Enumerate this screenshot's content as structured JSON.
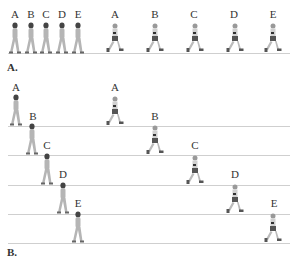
{
  "panels": [
    {
      "label": "A.",
      "description": "Walkers and runners in a single row",
      "walkers": [
        "A",
        "B",
        "C",
        "D",
        "E"
      ],
      "runners": [
        "A",
        "B",
        "C",
        "D",
        "E"
      ]
    },
    {
      "label": "B.",
      "description": "Walkers and runners staggered across rows",
      "walkers": [
        "A",
        "B",
        "C",
        "D",
        "E"
      ],
      "runners": [
        "A",
        "B",
        "C",
        "D",
        "E"
      ]
    }
  ],
  "colors": {
    "walker": "#b5b5b5",
    "walker_hair": "#444444",
    "runner_top": "#d0d0d0",
    "runner_shorts": "#555555",
    "line": "#cfcfcf"
  }
}
